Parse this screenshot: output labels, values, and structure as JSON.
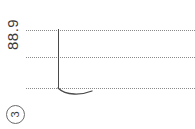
{
  "drawing": {
    "background_color": "#ffffff",
    "line_color": "#4a4a4a",
    "guide_color": "#8a8a8a",
    "orientation": "rotated-90-ccw",
    "dimension_label": "88.9",
    "callout_number": "3",
    "guides": [
      {
        "name": "guide-top",
        "y": 30
      },
      {
        "name": "guide-mid",
        "y": 57
      },
      {
        "name": "guide-bottom",
        "y": 88
      }
    ],
    "leader": {
      "x": 58,
      "y_top": 29,
      "y_bottom": 89
    },
    "arc": {
      "x_start": 58,
      "x_end": 92,
      "y_baseline": 88,
      "depth": 7
    }
  }
}
